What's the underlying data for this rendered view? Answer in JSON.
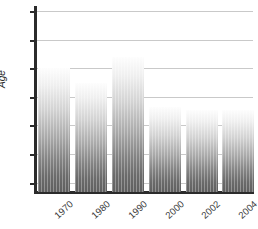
{
  "chart_data": {
    "type": "bar",
    "title": "",
    "subtitle": "",
    "xlabel": "",
    "ylabel": "Age",
    "categories": [
      "1970",
      "1980",
      "1990",
      "2000",
      "2002",
      "2004"
    ],
    "values": [
      68.0,
      67.0,
      68.8,
      65.3,
      65.1,
      65.1
    ],
    "series": [
      {
        "name": "Age",
        "values": [
          68.0,
          67.0,
          68.8,
          65.3,
          65.1,
          65.1
        ]
      }
    ],
    "ylim": [
      60,
      72
    ],
    "xlim": null,
    "ytick_labels": [
      "72",
      "70",
      "68",
      "66",
      "64",
      "62",
      "60"
    ],
    "ytick_values": [
      72,
      70,
      68,
      66,
      64,
      62,
      60
    ],
    "ytick_step": 2,
    "grid": "horizontal",
    "legend": "none",
    "annotations": [],
    "colors": {
      "grid": "#c9c9c9",
      "axis": "#2b2b2b",
      "bar_top": "#fdfdfd",
      "bar_bottom": "#5f5f5f",
      "text": "#3a3a3a",
      "background": "#ffffff"
    },
    "bar_style": "vertical-gradient-light-to-dark",
    "xtick_label_rotation": -42
  }
}
